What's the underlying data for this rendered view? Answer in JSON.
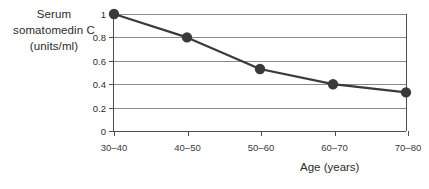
{
  "chart_data": {
    "type": "line",
    "title": "",
    "categories": [
      "30–40",
      "40–50",
      "50–60",
      "60–70",
      "70–80"
    ],
    "values": [
      1.0,
      0.8,
      0.53,
      0.4,
      0.33
    ],
    "xlabel": "Age (years)",
    "ylabel_lines": [
      "Serum",
      "somatomedin C",
      "(units/ml)"
    ],
    "ylabel": "Serum somatomedin C (units/ml)",
    "ylim": [
      0,
      1
    ],
    "ytick_labels": [
      "0",
      "0.2",
      "0.4",
      "0.6",
      "0.8",
      "1"
    ],
    "ytick_values": [
      0,
      0.2,
      0.4,
      0.6,
      0.8,
      1
    ],
    "grid": true,
    "legend": false,
    "series_color": "#3a3a3a",
    "grid_color": "#8a8a8a",
    "axis_color": "#4d4d4d",
    "marker": "circle"
  },
  "axis_titles": {
    "y_line1": "Serum",
    "y_line2": "somatomedin C",
    "y_line3": "(units/ml)",
    "x": "Age (years)"
  }
}
